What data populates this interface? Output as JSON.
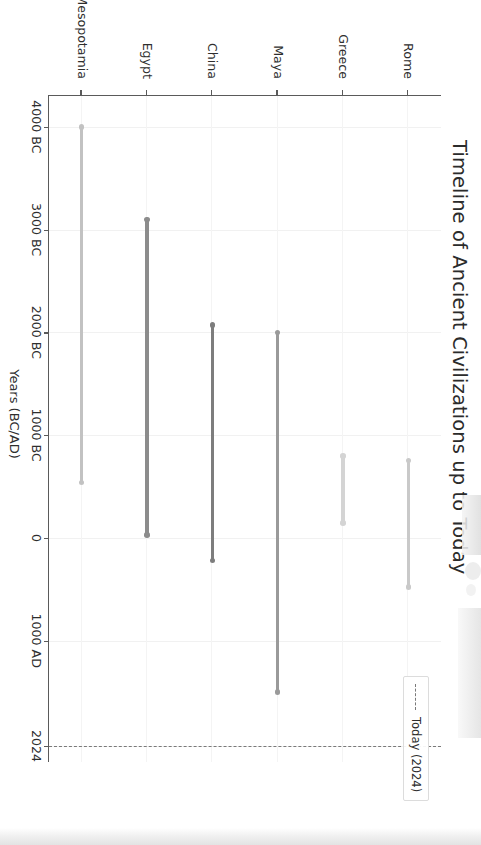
{
  "chart_data": {
    "type": "bar",
    "orientation": "timeline-range",
    "title": "Timeline of Ancient Civilizations up to Today",
    "xlabel": "Years (BC/AD)",
    "ylabel": "",
    "categories": [
      "Rome",
      "Greece",
      "Maya",
      "China",
      "Egypt",
      "Mesopotamia"
    ],
    "x_tick_labels": [
      "4000 BC",
      "3000 BC",
      "2000 BC",
      "1000 BC",
      "0",
      "1000 AD",
      "2024"
    ],
    "x_tick_values": [
      -4000,
      -3000,
      -2000,
      -1000,
      0,
      1000,
      2024
    ],
    "xlim": [
      -4300,
      2180
    ],
    "grid": true,
    "legend_position": "upper right",
    "series": [
      {
        "name": "Rome",
        "start_label": "753 BC",
        "end_label": "476 AD",
        "start": -753,
        "end": 476,
        "color": "#c9c9c9"
      },
      {
        "name": "Greece",
        "start_label": "800 BC",
        "end_label": "146 BC",
        "start": -800,
        "end": -146,
        "color": "#d4d4d4"
      },
      {
        "name": "Maya",
        "start_label": "2000 BC",
        "end_label": "1500 AD",
        "start": -2000,
        "end": 1500,
        "color": "#9a9a9a"
      },
      {
        "name": "China",
        "start_label": "2070 BC",
        "end_label": "220 AD",
        "start": -2070,
        "end": 220,
        "color": "#7d7d7d"
      },
      {
        "name": "Egypt",
        "start_label": "3100 BC",
        "end_label": "30 BC",
        "start": -3100,
        "end": -30,
        "color": "#8c8c8c"
      },
      {
        "name": "Mesopotamia",
        "start_label": "4000 BC",
        "end_label": "539 BC",
        "start": -4000,
        "end": -539,
        "color": "#c2c2c2"
      }
    ],
    "annotations": [
      {
        "name": "today-line",
        "label": "Today (2024)",
        "value": 2024,
        "style": "dashed",
        "color": "#7a7a7a"
      }
    ]
  },
  "legend": {
    "entries": [
      {
        "label": "Today (2024)",
        "marker": "dashed-line",
        "color": "#7a7a7a"
      }
    ]
  },
  "axes": {
    "x_axis_title": "Years (BC/AD)",
    "tick_color": "#2e2e2e",
    "spine_color": "#5a5a5a",
    "grid_color": "#f1f1f1"
  }
}
